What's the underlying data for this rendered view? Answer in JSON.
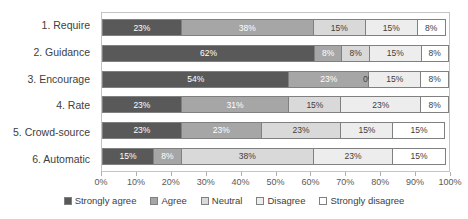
{
  "chart_data": {
    "type": "bar",
    "orientation": "horizontal",
    "stacked": true,
    "normalized_percent": true,
    "title": "",
    "xlabel": "",
    "ylabel": "",
    "xlim": [
      0,
      100
    ],
    "xticks": [
      0,
      10,
      20,
      30,
      40,
      50,
      60,
      70,
      80,
      90,
      100
    ],
    "xtick_labels": [
      "0%",
      "10%",
      "20%",
      "30%",
      "40%",
      "50%",
      "60%",
      "70%",
      "80%",
      "90%",
      "100%"
    ],
    "grid": false,
    "legend_position": "bottom",
    "categories": [
      "1. Require",
      "2. Guidance",
      "3. Encourage",
      "4. Rate",
      "5. Crowd-source",
      "6. Automatic"
    ],
    "series": [
      {
        "name": "Strongly agree",
        "color": "#595959",
        "values": [
          23,
          62,
          54,
          23,
          23,
          15
        ]
      },
      {
        "name": "Agree",
        "color": "#a6a6a6",
        "values": [
          38,
          8,
          23,
          31,
          23,
          8
        ]
      },
      {
        "name": "Neutral",
        "color": "#d9d9d9",
        "values": [
          15,
          8,
          0,
          15,
          23,
          38
        ]
      },
      {
        "name": "Disagree",
        "color": "#ededed",
        "values": [
          15,
          15,
          15,
          23,
          15,
          23
        ]
      },
      {
        "name": "Strongly disagree",
        "color": "#ffffff",
        "values": [
          8,
          8,
          8,
          8,
          15,
          15
        ]
      }
    ],
    "bar_labels": [
      [
        "23%",
        "38%",
        "15%",
        "15%",
        "8%"
      ],
      [
        "62%",
        "8%",
        "8%",
        "15%",
        "8%"
      ],
      [
        "54%",
        "23%",
        "0%",
        "15%",
        "8%"
      ],
      [
        "23%",
        "31%",
        "15%",
        "23%",
        "8%"
      ],
      [
        "23%",
        "23%",
        "23%",
        "15%",
        "15%"
      ],
      [
        "15%",
        "8%",
        "38%",
        "23%",
        "15%"
      ]
    ]
  },
  "colors": {
    "strongly_agree": "#595959",
    "agree": "#a6a6a6",
    "neutral": "#d9d9d9",
    "disagree": "#ededed",
    "strongly_disagree": "#ffffff",
    "segment_border": "#808080",
    "plot_border": "#c4c4c4",
    "text": "#404040"
  }
}
